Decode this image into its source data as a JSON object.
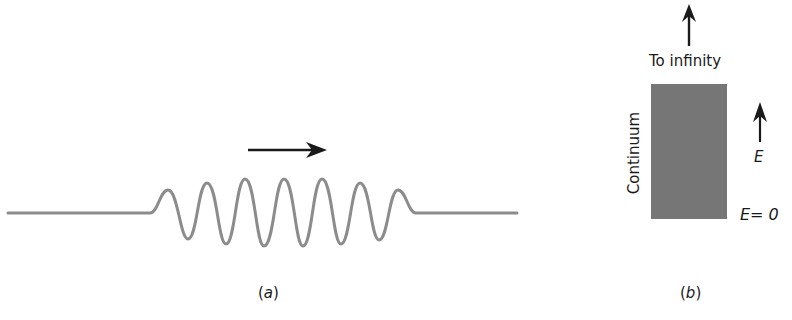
{
  "panel_a": {
    "caption_open": "(",
    "caption_letter": "a",
    "caption_close": ")",
    "description": "wave packet moving right",
    "arrow_direction": "right",
    "wave_color": "#8c8c8c",
    "arrow_color": "#1a1a1a"
  },
  "panel_b": {
    "caption_open": "(",
    "caption_letter": "b",
    "caption_close": ")",
    "top_label": "To infinity",
    "side_label": "Continuum",
    "energy_axis_label": "E",
    "zero_label": "E= 0",
    "band_color": "#767676",
    "arrow_color": "#1a1a1a"
  }
}
